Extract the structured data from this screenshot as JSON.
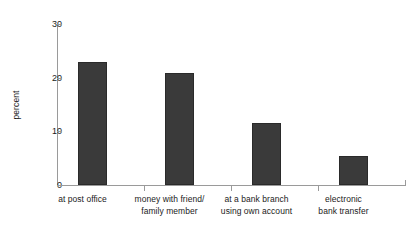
{
  "chart_data": {
    "type": "bar",
    "title": "",
    "subtitle": "",
    "xlabel": "",
    "ylabel": "percent",
    "categories": [
      "at post office",
      "money with friend/ family member",
      "at a bank branch using own account",
      "electronic bank transfer"
    ],
    "category_lines": [
      [
        "at post office"
      ],
      [
        "money with friend/",
        "family member"
      ],
      [
        "at a bank branch",
        "using own account"
      ],
      [
        "electronic",
        "bank transfer"
      ]
    ],
    "values": [
      23.0,
      20.8,
      11.6,
      5.4
    ],
    "ylim": [
      0,
      30
    ],
    "yticks": [
      0,
      10,
      20,
      30
    ],
    "ytick_labels": [
      "0",
      "10",
      "20",
      "30"
    ],
    "grid": false,
    "legend": false,
    "bar_color": "#3a3a3a",
    "axis_color": "#9a9a9a",
    "text_color": "#1b1b1b",
    "background": "#ffffff"
  }
}
